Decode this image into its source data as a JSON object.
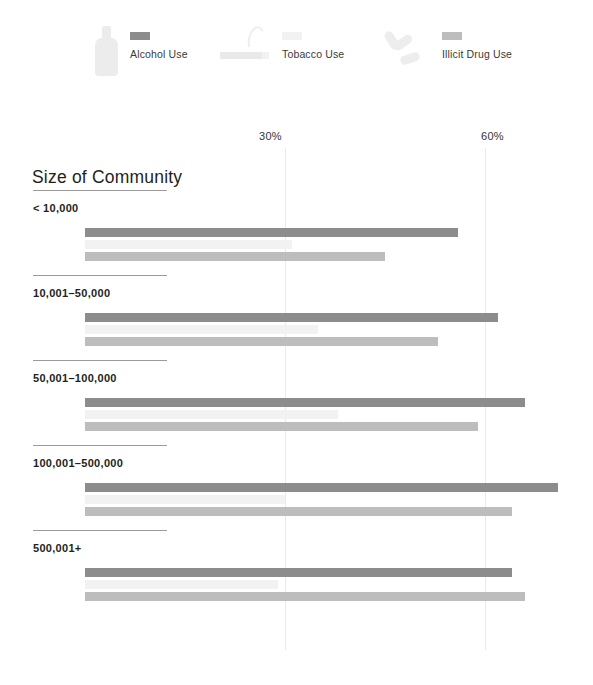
{
  "legend": {
    "items": [
      {
        "label": "Alcohol Use",
        "icon": "bottle-icon",
        "color": "#8c8c8c"
      },
      {
        "label": "Tobacco Use",
        "icon": "cigarette-icon",
        "color": "#f2f2f2"
      },
      {
        "label": "Illicit Drug Use",
        "icon": "pills-icon",
        "color": "#bdbdbd"
      }
    ]
  },
  "chart_data": {
    "type": "bar",
    "orientation": "horizontal",
    "title": "Size of Community",
    "xlabel": "",
    "ylabel": "",
    "xlim": [
      0,
      75
    ],
    "grid": true,
    "gridlines": [
      30,
      60
    ],
    "tick_labels": [
      "30%",
      "60%"
    ],
    "legend_position": "top",
    "unit": "%",
    "categories": [
      "< 10,000",
      "10,001–50,000",
      "50,001–100,000",
      "100,001–500,000",
      "500,001+"
    ],
    "series": [
      {
        "name": "Alcohol Use",
        "color": "#8c8c8c",
        "values": [
          56,
          62,
          66,
          71,
          64
        ]
      },
      {
        "name": "Tobacco Use",
        "color": "#f2f2f2",
        "values": [
          31,
          35,
          38,
          30,
          29
        ]
      },
      {
        "name": "Illicit Drug Use",
        "color": "#bdbdbd",
        "values": [
          45,
          53,
          59,
          64,
          66
        ]
      }
    ],
    "groups": [
      {
        "label": "< 10,000",
        "rows": [
          {
            "series": "Alcohol Use",
            "value": "56",
            "suffix": "%",
            "color": "#8c8c8c"
          },
          {
            "series": "Tobacco Use",
            "value": "31",
            "suffix": "",
            "color": "#f2f2f2"
          },
          {
            "series": "Illicit Drug Use",
            "value": "45",
            "suffix": "",
            "color": "#bdbdbd"
          }
        ]
      },
      {
        "label": "10,001–50,000",
        "rows": [
          {
            "series": "Alcohol Use",
            "value": "62",
            "suffix": "%",
            "color": "#8c8c8c"
          },
          {
            "series": "Tobacco Use",
            "value": "35",
            "suffix": "",
            "color": "#f2f2f2"
          },
          {
            "series": "Illicit Drug Use",
            "value": "53",
            "suffix": "",
            "color": "#bdbdbd"
          }
        ]
      },
      {
        "label": "50,001–100,000",
        "rows": [
          {
            "series": "Alcohol Use",
            "value": "66",
            "suffix": "%",
            "color": "#8c8c8c"
          },
          {
            "series": "Tobacco Use",
            "value": "38",
            "suffix": "",
            "color": "#f2f2f2"
          },
          {
            "series": "Illicit Drug Use",
            "value": "59",
            "suffix": "",
            "color": "#bdbdbd"
          }
        ]
      },
      {
        "label": "100,001–500,000",
        "rows": [
          {
            "series": "Alcohol Use",
            "value": "71",
            "suffix": "%",
            "color": "#8c8c8c"
          },
          {
            "series": "Tobacco Use",
            "value": "30",
            "suffix": "",
            "color": "#f2f2f2"
          },
          {
            "series": "Illicit Drug Use",
            "value": "64",
            "suffix": "",
            "color": "#bdbdbd"
          }
        ]
      },
      {
        "label": "500,001+",
        "rows": [
          {
            "series": "Alcohol Use",
            "value": "64",
            "suffix": "%",
            "color": "#8c8c8c"
          },
          {
            "series": "Tobacco Use",
            "value": "29",
            "suffix": "",
            "color": "#f2f2f2"
          },
          {
            "series": "Illicit Drug Use",
            "value": "66",
            "suffix": "",
            "color": "#bdbdbd"
          }
        ]
      }
    ]
  },
  "layout": {
    "bar_origin_x": 85,
    "px_per_percent": 6.667,
    "group_tops": [
      190,
      275,
      360,
      445,
      530
    ],
    "heading_offset": 12,
    "first_bar_offset": 38,
    "bar_gap": 12
  }
}
